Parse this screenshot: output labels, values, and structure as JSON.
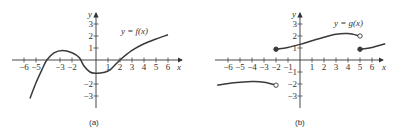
{
  "chart_data": [
    {
      "type": "line",
      "panel": "(a)",
      "title": "",
      "legend": "y = f(x)",
      "xlabel": "x",
      "ylabel": "y",
      "xlim": [
        -6,
        6
      ],
      "ylim": [
        -3,
        3
      ],
      "x_ticks": [
        -6,
        -5,
        -3,
        -2,
        1,
        2,
        3,
        4,
        5,
        6
      ],
      "x_tick_labels": [
        "−6",
        "−5",
        "−3",
        "−2",
        "1",
        "2",
        "3",
        "4",
        "5",
        "6"
      ],
      "y_ticks": [
        3,
        2,
        1,
        -2,
        -3
      ],
      "y_tick_labels": [
        "3",
        "2",
        "1",
        "−2",
        "−3"
      ],
      "grid": false,
      "series": [
        {
          "name": "f(x)",
          "x": [
            -5.5,
            -5,
            -4.5,
            -4.1,
            -3.5,
            -2.8,
            -2,
            -1.4,
            -1,
            -0.5,
            0,
            0.6,
            1.2,
            2,
            3,
            4,
            5,
            6
          ],
          "y": [
            -3.2,
            -1.9,
            -0.8,
            0,
            0.6,
            0.8,
            0.6,
            0.2,
            -0.5,
            -1,
            -1.1,
            -1.05,
            -0.8,
            0,
            0.8,
            1.35,
            1.75,
            2.1
          ]
        }
      ]
    },
    {
      "type": "line",
      "panel": "(b)",
      "title": "",
      "legend": "y = g(x)",
      "xlabel": "x",
      "ylabel": "y",
      "xlim": [
        -6,
        6
      ],
      "ylim": [
        -3,
        3
      ],
      "x_ticks": [
        -6,
        -5,
        -4,
        -3,
        -2,
        -1,
        1,
        2,
        3,
        4,
        5,
        6
      ],
      "x_tick_labels": [
        "−6",
        "−5",
        "−4",
        "−3",
        "−2",
        "−1",
        "1",
        "2",
        "3",
        "4",
        "5",
        "6"
      ],
      "y_ticks": [
        3,
        2,
        1,
        -1,
        -2,
        -3
      ],
      "y_tick_labels": [
        "3",
        "2",
        "1",
        "−1",
        "−2",
        "−3"
      ],
      "grid": false,
      "series": [
        {
          "name": "g(x) piece 1",
          "x": [
            -6.9,
            -5.5,
            -4,
            -3,
            -2
          ],
          "y": [
            -2.1,
            -1.9,
            -1.8,
            -1.85,
            -2.1
          ],
          "endpoints": {
            "left": "none",
            "right": "open"
          }
        },
        {
          "name": "g(x) piece 2",
          "x": [
            -2,
            -1,
            0,
            1,
            2,
            3,
            4,
            5
          ],
          "y": [
            0.9,
            1.05,
            1.3,
            1.6,
            1.9,
            2.15,
            2.2,
            2.0
          ],
          "endpoints": {
            "left": "closed",
            "right": "open"
          }
        },
        {
          "name": "g(x) piece 3",
          "x": [
            5,
            6,
            7.1
          ],
          "y": [
            0.9,
            1.05,
            1.35
          ],
          "endpoints": {
            "left": "closed",
            "right": "none"
          }
        }
      ]
    }
  ],
  "panels": {
    "a": {
      "caption": "(a)",
      "legend": "y = f(x)",
      "x_axis_label": "x",
      "y_axis_label": "y"
    },
    "b": {
      "caption": "(b)",
      "legend": "y = g(x)",
      "x_axis_label": "x",
      "y_axis_label": "y"
    }
  }
}
